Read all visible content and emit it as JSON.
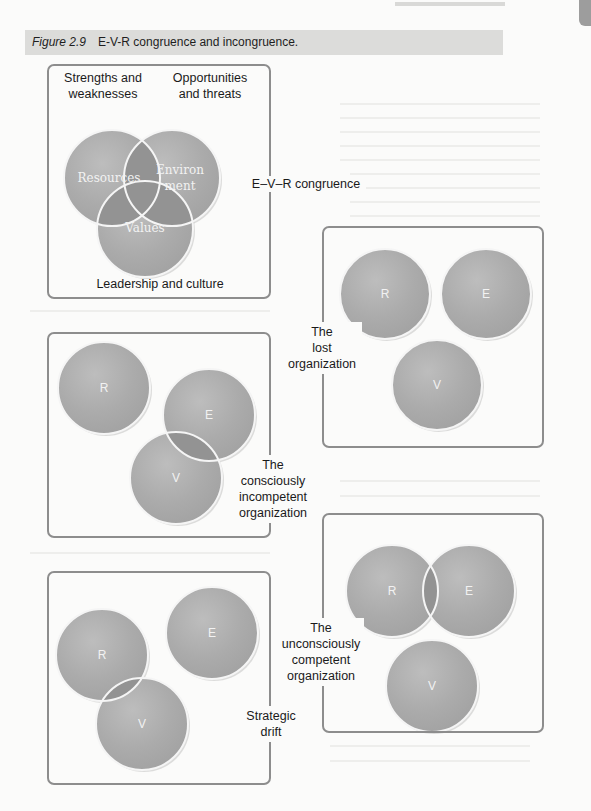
{
  "figure": {
    "number": "Figure 2.9",
    "title": "E-V-R congruence and incongruence."
  },
  "colors": {
    "circle_fill": "#a9a9a9",
    "overlap_fill": "#8e8e8e",
    "box_border": "#8d8d8d",
    "caption_bg": "#dcdcda"
  },
  "panels": {
    "congruence": {
      "label": "E–V–R congruence",
      "top_left_label_line1": "Strengths and",
      "top_left_label_line2": "weaknesses",
      "top_right_label_line1": "Opportunities",
      "top_right_label_line2": "and threats",
      "bottom_label": "Leadership and culture",
      "circles": {
        "resources": "Resources",
        "environment_line1": "Environ",
        "environment_line2": "ment",
        "values": "Values"
      }
    },
    "lost": {
      "label_line1": "The",
      "label_line2": "lost",
      "label_line3": "organization",
      "circles": {
        "r": "R",
        "e": "E",
        "v": "V"
      }
    },
    "consciously_incompetent": {
      "label_line1": "The",
      "label_line2": "consciously",
      "label_line3": "incompetent",
      "label_line4": "organization",
      "circles": {
        "r": "R",
        "e": "E",
        "v": "V"
      }
    },
    "unconsciously_competent": {
      "label_line1": "The",
      "label_line2": "unconsciously",
      "label_line3": "competent",
      "label_line4": "organization",
      "circles": {
        "r": "R",
        "e": "E",
        "v": "V"
      }
    },
    "strategic_drift": {
      "label_line1": "Strategic",
      "label_line2": "drift",
      "circles": {
        "r": "R",
        "e": "E",
        "v": "V"
      }
    }
  }
}
